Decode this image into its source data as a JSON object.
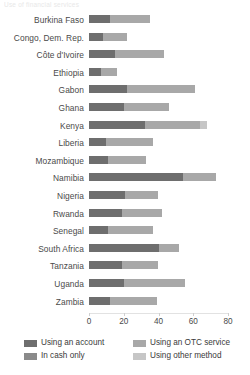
{
  "title": "Use of financial services",
  "chart_data": {
    "type": "bar",
    "orientation": "horizontal",
    "stacked": true,
    "title": "Use of financial services",
    "xlabel": "",
    "ylabel": "",
    "xlim": [
      0,
      80
    ],
    "xticks": [
      0,
      20,
      40,
      60,
      80
    ],
    "grid": false,
    "legend_position": "bottom",
    "categories": [
      "Burkina Faso",
      "Congo, Dem. Rep.",
      "Côte d'Ivoire",
      "Ethiopia",
      "Gabon",
      "Ghana",
      "Kenya",
      "Liberia",
      "Mozambique",
      "Namibia",
      "Nigeria",
      "Rwanda",
      "Senegal",
      "South Africa",
      "Tanzania",
      "Uganda",
      "Zambia"
    ],
    "series": [
      {
        "name": "Using an account",
        "color": "#6e6e6e",
        "values": [
          12,
          8,
          15,
          7,
          22,
          20,
          32,
          10,
          11,
          54,
          21,
          19,
          11,
          40,
          19,
          20,
          12
        ]
      },
      {
        "name": "In cash only",
        "color": "#8a8a8a",
        "values": [
          0,
          0,
          0,
          0,
          0,
          0,
          0,
          0,
          0,
          0,
          0,
          0,
          0,
          0,
          0,
          0,
          0
        ]
      },
      {
        "name": "Using an OTC service",
        "color": "#a8a8a8",
        "values": [
          23,
          14,
          28,
          9,
          39,
          26,
          32,
          27,
          22,
          19,
          19,
          23,
          26,
          12,
          21,
          35,
          27
        ]
      },
      {
        "name": "Using other method",
        "color": "#c6c6c6",
        "values": [
          0,
          0,
          0,
          0,
          0,
          0,
          4,
          0,
          0,
          0,
          0,
          0,
          0,
          0,
          0,
          0,
          0
        ]
      }
    ],
    "totals": [
      35,
      22,
      43,
      16,
      61,
      46,
      68,
      37,
      33,
      73,
      40,
      42,
      37,
      52,
      40,
      55,
      39
    ]
  },
  "axis": {
    "ticks": [
      {
        "value": 0,
        "label": "0"
      },
      {
        "value": 20,
        "label": "20"
      },
      {
        "value": 40,
        "label": "40"
      },
      {
        "value": 60,
        "label": "60"
      },
      {
        "value": 80,
        "label": "80"
      }
    ]
  },
  "legend": {
    "items": [
      {
        "label": "Using an account",
        "color": "#6e6e6e"
      },
      {
        "label": "In cash only",
        "color": "#8a8a8a"
      },
      {
        "label": "Using an OTC service",
        "color": "#a8a8a8"
      },
      {
        "label": "Using other method",
        "color": "#c6c6c6"
      }
    ]
  }
}
